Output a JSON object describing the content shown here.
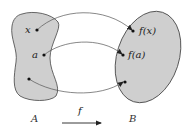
{
  "diagram": {
    "domain_set": {
      "label": "A",
      "fill": "#cfcfcf",
      "stroke": "#444444",
      "points": [
        {
          "label": "x"
        },
        {
          "label": "a"
        },
        {
          "label": ""
        }
      ]
    },
    "codomain_set": {
      "label": "B",
      "fill": "#cfcfcf",
      "stroke": "#444444",
      "points": [
        {
          "label": "f(x)"
        },
        {
          "label": "f(a)"
        },
        {
          "label": ""
        }
      ]
    },
    "mappings": [
      {
        "from": "x",
        "to": "f(x)"
      },
      {
        "from": "a",
        "to": "f(a)"
      },
      {
        "from": "",
        "to": ""
      }
    ],
    "function_arrow": {
      "label": "f"
    }
  }
}
